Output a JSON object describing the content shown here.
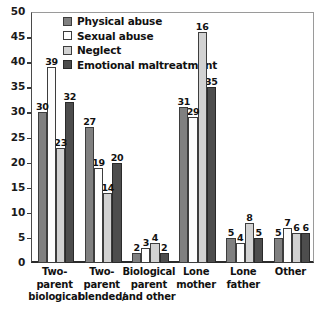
{
  "chart_data": {
    "type": "bar",
    "title": "",
    "subtitle": "",
    "xlabel": "",
    "ylabel": "",
    "ylim": [
      0,
      50
    ],
    "ytick_step": 5,
    "yticks": [
      "50",
      "45",
      "40",
      "35",
      "30",
      "25",
      "20",
      "15",
      "10",
      "5",
      "0"
    ],
    "grid": false,
    "legend_position": "top-left-inside",
    "categories": [
      "Two-parent biological",
      "Two-parent blended/",
      "Biological parent and other",
      "Lone mother",
      "Lone father",
      "Other"
    ],
    "category_lines": [
      [
        "Two-",
        "parent",
        "biological"
      ],
      [
        "Two-",
        "parent",
        "blended/"
      ],
      [
        "Biological",
        "parent",
        "and other"
      ],
      [
        "Lone",
        "mother"
      ],
      [
        "Lone",
        "father"
      ],
      [
        "Other"
      ]
    ],
    "series": [
      {
        "name": "Physical abuse",
        "color": "#808080",
        "values": [
          30,
          27,
          2,
          31,
          5,
          5
        ],
        "labels": [
          "30",
          "27",
          "2",
          "31",
          "5",
          "5"
        ]
      },
      {
        "name": "Sexual abuse",
        "color": "#ffffff",
        "values": [
          39,
          19,
          3,
          29,
          4,
          7
        ],
        "labels": [
          "39",
          "19",
          "3",
          "29",
          "4",
          "7"
        ]
      },
      {
        "name": "Neglect",
        "color": "#d2d2d2",
        "values": [
          23,
          14,
          4,
          46,
          8,
          6
        ],
        "labels": [
          "23",
          "14",
          "4",
          "16",
          "8",
          "6"
        ]
      },
      {
        "name": "Emotional maltreatment",
        "color": "#4d4d4d",
        "values": [
          32,
          20,
          2,
          35,
          5,
          6
        ],
        "labels": [
          "32",
          "20",
          "2",
          "35",
          "5",
          "6"
        ]
      }
    ]
  },
  "legend": {
    "items": [
      {
        "label": "Physical abuse"
      },
      {
        "label": "Sexual abuse"
      },
      {
        "label": "Neglect"
      },
      {
        "label": "Emotional maltreatment"
      }
    ]
  }
}
